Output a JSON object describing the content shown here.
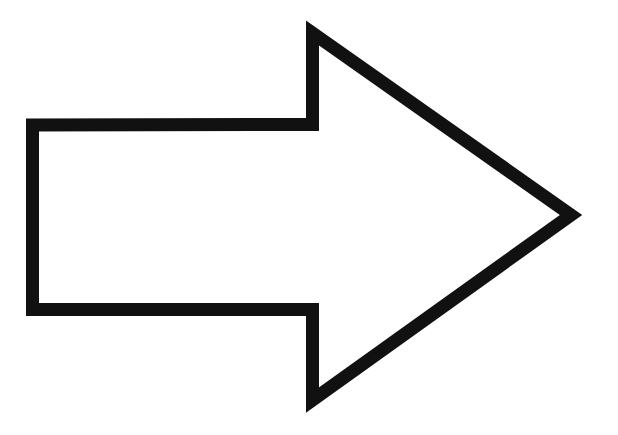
{
  "diagram": {
    "shape": "block-arrow",
    "direction": "right",
    "style": "outline",
    "stroke_color": "#111111",
    "fill_color": "#ffffff",
    "background_color": "#ffffff"
  }
}
